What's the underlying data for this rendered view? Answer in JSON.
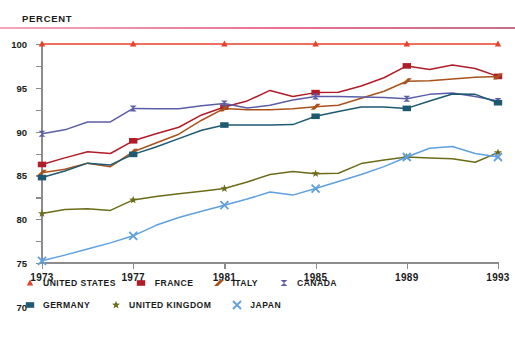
{
  "axis_title": "PERCENT",
  "legend": {
    "row1": [
      {
        "label": "UNITED STATES",
        "marker": "triangle-marker-icon",
        "color": "#e8402a"
      },
      {
        "label": "FRANCE",
        "marker": "square-marker-icon",
        "color": "#b01c28"
      },
      {
        "label": "ITALY",
        "marker": "arrow-marker-icon",
        "color": "#a8521d"
      },
      {
        "label": "CANADA",
        "marker": "bowtie-marker-icon",
        "color": "#5b5ea6"
      }
    ],
    "row2": [
      {
        "label": "GERMANY",
        "marker": "square-marker-icon",
        "color": "#1d5a72"
      },
      {
        "label": "UNITED KINGDOM",
        "marker": "star-marker-icon",
        "color": "#6b6b19"
      },
      {
        "label": "JAPAN",
        "marker": "cross-marker-icon",
        "color": "#5fa0dd"
      }
    ]
  },
  "chart_data": {
    "type": "line",
    "title": "",
    "xlabel": "",
    "ylabel": "PERCENT",
    "ylim": [
      50,
      100
    ],
    "ytick_labels": [
      "50",
      "55",
      "60",
      "65",
      "70",
      "75",
      "80",
      "85",
      "90",
      "95",
      "100"
    ],
    "yticks": [
      50,
      55,
      60,
      65,
      70,
      75,
      80,
      85,
      90,
      95,
      100
    ],
    "xlim": [
      1973,
      1993
    ],
    "xtick_labels": [
      "1973",
      "1977",
      "1981",
      "1985",
      "1989",
      "1993"
    ],
    "xticks": [
      1973,
      1977,
      1981,
      1985,
      1989,
      1993
    ],
    "x": [
      1973,
      1974,
      1975,
      1976,
      1977,
      1978,
      1979,
      1980,
      1981,
      1982,
      1983,
      1984,
      1985,
      1986,
      1987,
      1988,
      1989,
      1990,
      1991,
      1992,
      1993
    ],
    "grid": false,
    "legend_position": "below",
    "series": [
      {
        "name": "UNITED STATES",
        "color": "#e8402a",
        "marker": "triangle",
        "values": [
          100,
          100,
          100,
          100,
          100,
          100,
          100,
          100,
          100,
          100,
          100,
          100,
          100,
          100,
          100,
          100,
          100,
          100,
          100,
          100,
          100
        ]
      },
      {
        "name": "FRANCE",
        "color": "#b01c28",
        "marker": "square",
        "values": [
          72.5,
          74.0,
          75.4,
          75.0,
          77.9,
          79.5,
          81.0,
          83.8,
          85.6,
          87.0,
          89.4,
          88.0,
          88.9,
          89.0,
          90.4,
          92.3,
          95.0,
          94.2,
          95.2,
          94.4,
          92.6
        ]
      },
      {
        "name": "ITALY",
        "color": "#a8521d",
        "marker": "arrow",
        "values": [
          70.6,
          71.4,
          72.8,
          72.0,
          75.4,
          77.4,
          79.4,
          82.6,
          85.3,
          85.0,
          85.0,
          85.2,
          85.7,
          86.0,
          87.6,
          89.2,
          91.5,
          91.6,
          92.0,
          92.4,
          92.6
        ]
      },
      {
        "name": "CANADA",
        "color": "#5b5ea6",
        "marker": "bowtie",
        "values": [
          79.5,
          80.4,
          82.2,
          82.2,
          85.3,
          85.2,
          85.2,
          85.9,
          86.4,
          85.4,
          86.0,
          87.2,
          88.0,
          88.0,
          87.9,
          87.8,
          87.5,
          88.5,
          88.8,
          88.0,
          87.0
        ]
      },
      {
        "name": "GERMANY",
        "color": "#1d5a72",
        "marker": "square",
        "values": [
          69.5,
          71.0,
          72.8,
          72.4,
          74.8,
          76.5,
          78.4,
          80.3,
          81.5,
          81.5,
          81.5,
          81.6,
          83.5,
          84.6,
          85.6,
          85.6,
          85.3,
          87.0,
          88.6,
          88.5,
          86.6
        ]
      },
      {
        "name": "UNITED KINGDOM",
        "color": "#6b6b19",
        "marker": "star",
        "values": [
          61.3,
          62.2,
          62.4,
          62.0,
          64.4,
          65.2,
          65.8,
          66.4,
          67.0,
          68.5,
          70.2,
          70.9,
          70.4,
          70.5,
          72.7,
          73.5,
          74.2,
          74.0,
          73.8,
          73.0,
          75.2
        ]
      },
      {
        "name": "JAPAN",
        "color": "#5fa0dd",
        "marker": "cross",
        "values": [
          50.5,
          51.8,
          53.2,
          54.6,
          56.2,
          58.6,
          60.4,
          61.8,
          63.2,
          64.6,
          66.2,
          65.5,
          67.0,
          68.6,
          70.2,
          72.0,
          74.2,
          76.2,
          76.6,
          75.0,
          74.2
        ]
      }
    ]
  }
}
